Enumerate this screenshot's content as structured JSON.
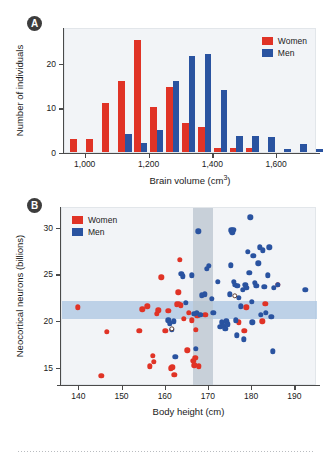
{
  "figure": {
    "panel_a_tag": "A",
    "panel_b_tag": "B"
  },
  "chart_data": [
    {
      "id": "panel-a",
      "type": "bar",
      "title": "",
      "xlabel": "Brain volume (cm³)",
      "ylabel": "Number of individuals",
      "xlim": [
        935,
        1725
      ],
      "ylim": [
        0,
        28
      ],
      "xticks": [
        1000,
        1200,
        1400,
        1600
      ],
      "xticklabels": [
        "1,000",
        "1,200",
        "1,400",
        "1,600"
      ],
      "yticks": [
        0,
        10,
        20
      ],
      "yticklabels": [
        "0",
        "10",
        "20"
      ],
      "bin_width": 50,
      "grid": false,
      "legend_position": "top-right",
      "legend": [
        "Women",
        "Men"
      ],
      "colors": {
        "women": "#e03326",
        "men": "#2a53a0"
      },
      "categories": [
        950,
        1000,
        1050,
        1100,
        1150,
        1200,
        1250,
        1300,
        1350,
        1400,
        1450,
        1500,
        1550,
        1600,
        1650,
        1700
      ],
      "series": [
        {
          "name": "Women",
          "values": [
            3,
            3,
            11,
            16,
            25,
            10,
            14.5,
            6.5,
            5.5,
            1,
            1,
            0.8,
            0,
            0,
            0,
            0
          ]
        },
        {
          "name": "Men",
          "values": [
            0,
            0,
            0,
            4,
            2,
            5,
            16,
            21.5,
            22,
            14,
            3.5,
            3.5,
            3.3,
            0.6,
            1.7,
            0.7
          ]
        }
      ]
    },
    {
      "id": "panel-b",
      "type": "scatter",
      "title": "",
      "xlabel": "Body height (cm)",
      "ylabel": "Neocortical neurons (billions)",
      "xlim": [
        136,
        195
      ],
      "ylim": [
        13.2,
        32.2
      ],
      "xticks": [
        140,
        150,
        160,
        170,
        180,
        190
      ],
      "xticklabels": [
        "140",
        "150",
        "160",
        "170",
        "180",
        "190"
      ],
      "yticks": [
        15,
        20,
        25,
        30
      ],
      "yticklabels": [
        "15",
        "20",
        "25",
        "30"
      ],
      "grid": false,
      "legend_position": "top-left",
      "legend": [
        "Women",
        "Men"
      ],
      "colors": {
        "women": "#e03326",
        "men": "#2a53a0"
      },
      "bands": {
        "horizontal_y_range": [
          20.3,
          22.3
        ],
        "vertical_x_range": [
          166.2,
          171.0
        ]
      },
      "series": [
        {
          "name": "Women",
          "points": [
            [
              139.6,
              21.6
            ],
            [
              145.1,
              14.3
            ],
            [
              146.3,
              19.0
            ],
            [
              153.9,
              19.1
            ],
            [
              154.6,
              21.4
            ],
            [
              155.7,
              21.7
            ],
            [
              156.3,
              15.3
            ],
            [
              157.0,
              16.4
            ],
            [
              157.2,
              15.8
            ],
            [
              158.0,
              20.9
            ],
            [
              158.3,
              21.3
            ],
            [
              159.0,
              24.8
            ],
            [
              159.9,
              19.1
            ],
            [
              160.6,
              21.2
            ],
            [
              161.2,
              15.1
            ],
            [
              161.5,
              15.2
            ],
            [
              162.0,
              14.4
            ],
            [
              162.6,
              21.9
            ],
            [
              162.9,
              23.2
            ],
            [
              163.0,
              22.0
            ],
            [
              163.3,
              26.7
            ],
            [
              163.5,
              21.8
            ],
            [
              164.2,
              20.4
            ],
            [
              165.0,
              17.0
            ],
            [
              165.4,
              21.0
            ],
            [
              166.0,
              20.2
            ],
            [
              166.4,
              15.9
            ],
            [
              166.6,
              15.4
            ],
            [
              166.8,
              16.2
            ],
            [
              167.0,
              19.2
            ],
            [
              167.3,
              20.7
            ],
            [
              167.6,
              15.3
            ],
            [
              169.2,
              20.8
            ],
            [
              176.9,
              20.0
            ],
            [
              178.2,
              19.1
            ],
            [
              178.6,
              21.6
            ],
            [
              182.3,
              20.1
            ],
            [
              183.0,
              22.0
            ],
            [
              186.0,
              24.0
            ]
          ]
        },
        {
          "name": "Men",
          "points": [
            [
              160.6,
              20.2
            ],
            [
              161.0,
              19.9
            ],
            [
              161.4,
              19.2
            ],
            [
              161.8,
              20.1
            ],
            [
              162.2,
              16.3
            ],
            [
              163.6,
              25.2
            ],
            [
              164.0,
              24.9
            ],
            [
              164.6,
              22.1
            ],
            [
              166.0,
              25.0
            ],
            [
              166.6,
              20.9
            ],
            [
              167.0,
              17.2
            ],
            [
              167.2,
              21.0
            ],
            [
              167.5,
              29.7
            ],
            [
              168.0,
              20.8
            ],
            [
              168.4,
              22.9
            ],
            [
              169.0,
              23.0
            ],
            [
              169.5,
              25.7
            ],
            [
              170.0,
              26.0
            ],
            [
              170.6,
              22.5
            ],
            [
              171.0,
              21.0
            ],
            [
              172.0,
              24.3
            ],
            [
              172.6,
              19.5
            ],
            [
              173.0,
              20.0
            ],
            [
              173.4,
              19.6
            ],
            [
              173.8,
              19.3
            ],
            [
              174.0,
              20.1
            ],
            [
              174.4,
              19.8
            ],
            [
              174.8,
              23.0
            ],
            [
              175.0,
              26.1
            ],
            [
              175.2,
              29.8
            ],
            [
              175.4,
              29.6
            ],
            [
              175.6,
              29.9
            ],
            [
              175.8,
              24.3
            ],
            [
              176.0,
              24.0
            ],
            [
              176.2,
              20.2
            ],
            [
              176.4,
              18.6
            ],
            [
              176.6,
              23.9
            ],
            [
              176.9,
              22.6
            ],
            [
              177.4,
              21.7
            ],
            [
              177.8,
              23.5
            ],
            [
              178.0,
              18.2
            ],
            [
              178.4,
              24.0
            ],
            [
              178.6,
              23.7
            ],
            [
              179.0,
              27.5
            ],
            [
              179.3,
              25.3
            ],
            [
              179.6,
              31.2
            ],
            [
              179.9,
              22.2
            ],
            [
              180.0,
              20.0
            ],
            [
              180.3,
              27.1
            ],
            [
              180.6,
              24.2
            ],
            [
              181.0,
              23.9
            ],
            [
              181.4,
              26.3
            ],
            [
              181.8,
              28.0
            ],
            [
              182.0,
              20.8
            ],
            [
              182.4,
              27.7
            ],
            [
              182.8,
              23.8
            ],
            [
              183.2,
              21.0
            ],
            [
              183.6,
              25.0
            ],
            [
              184.0,
              28.0
            ],
            [
              184.4,
              20.6
            ],
            [
              184.8,
              16.9
            ],
            [
              185.0,
              23.7
            ],
            [
              186.0,
              24.0
            ],
            [
              192.3,
              23.5
            ]
          ]
        },
        {
          "name": "Open markers",
          "points": [
            [
              161.4,
              19.3
            ],
            [
              176.0,
              22.8
            ]
          ]
        }
      ]
    }
  ]
}
